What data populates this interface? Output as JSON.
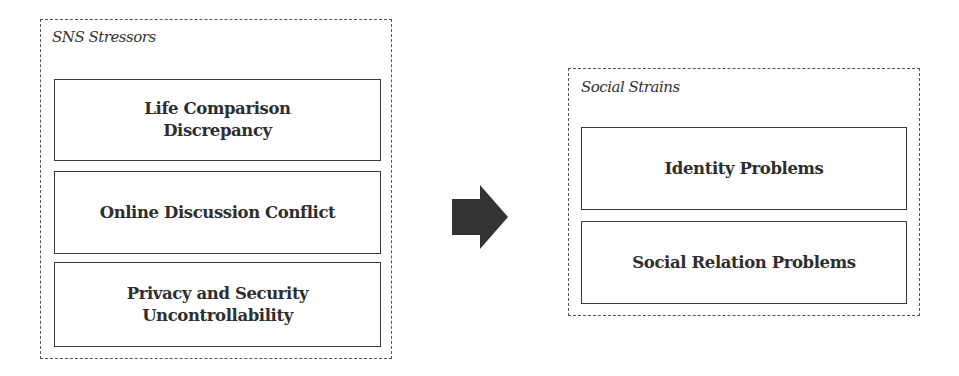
{
  "diagram": {
    "groups": [
      {
        "title": "SNS Stressors",
        "items": [
          "Life Comparison\nDiscrepancy",
          "Online Discussion Conflict",
          "Privacy and Security\nUncontrollability"
        ]
      },
      {
        "title": "Social Strains",
        "items": [
          "Identity Problems",
          "Social Relation Problems"
        ]
      }
    ],
    "connector": {
      "icon": "right-arrow-icon",
      "from": "SNS Stressors",
      "to": "Social Strains",
      "color": "#333333"
    }
  }
}
